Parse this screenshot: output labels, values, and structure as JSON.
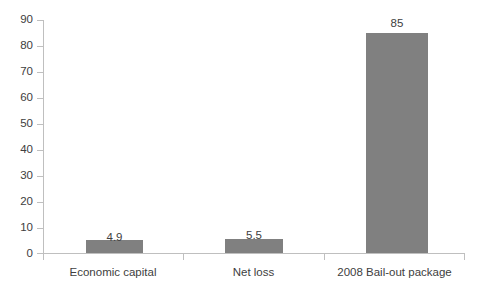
{
  "chart_data": {
    "type": "bar",
    "title": "",
    "subtitle": "",
    "xlabel": "",
    "ylabel": "",
    "categories": [
      "Economic capital",
      "Net loss",
      "2008 Bail-out package"
    ],
    "values": [
      4.9,
      5.5,
      85
    ],
    "value_labels": [
      "4.9",
      "5.5",
      "85"
    ],
    "series": [
      {
        "name": "",
        "values": [
          4.9,
          5.5,
          85
        ]
      }
    ],
    "ylim": [
      0,
      90
    ],
    "y_ticks": [
      0,
      10,
      20,
      30,
      40,
      50,
      60,
      70,
      80,
      90
    ],
    "y_tick_labels": [
      "0",
      "10",
      "20",
      "30",
      "40",
      "50",
      "60",
      "70",
      "80",
      "90"
    ],
    "grid": false,
    "legend": false,
    "legend_position": "none",
    "bar_color": "#808080",
    "axis_color": "#bfbfbf",
    "text_color": "#404040",
    "background_color": "#ffffff"
  }
}
